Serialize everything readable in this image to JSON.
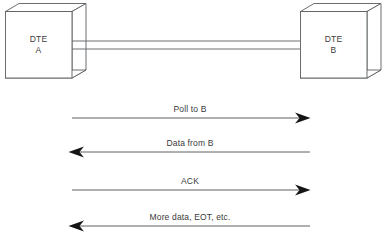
{
  "diagram": {
    "type": "sequence-diagram",
    "title": "",
    "background_color": "#ffffff",
    "line_color": "#55595c",
    "text_color": "#3a3a3a",
    "nodes": [
      {
        "id": "dte-a",
        "label_line1": "DTE",
        "label_line2": "A",
        "shape": "3d-box",
        "side": "left"
      },
      {
        "id": "dte-b",
        "label_line1": "DTE",
        "label_line2": "B",
        "shape": "3d-box",
        "side": "right"
      }
    ],
    "link": {
      "style": "double-line",
      "lines": 2,
      "from": "dte-a",
      "to": "dte-b"
    },
    "messages": [
      {
        "label": "Poll to B",
        "direction": "right",
        "from": "dte-a",
        "to": "dte-b"
      },
      {
        "label": "Data from B",
        "direction": "left",
        "from": "dte-b",
        "to": "dte-a"
      },
      {
        "label": "ACK",
        "direction": "right",
        "from": "dte-a",
        "to": "dte-b"
      },
      {
        "label": "More data, EOT, etc.",
        "direction": "left",
        "from": "dte-b",
        "to": "dte-a"
      }
    ]
  }
}
